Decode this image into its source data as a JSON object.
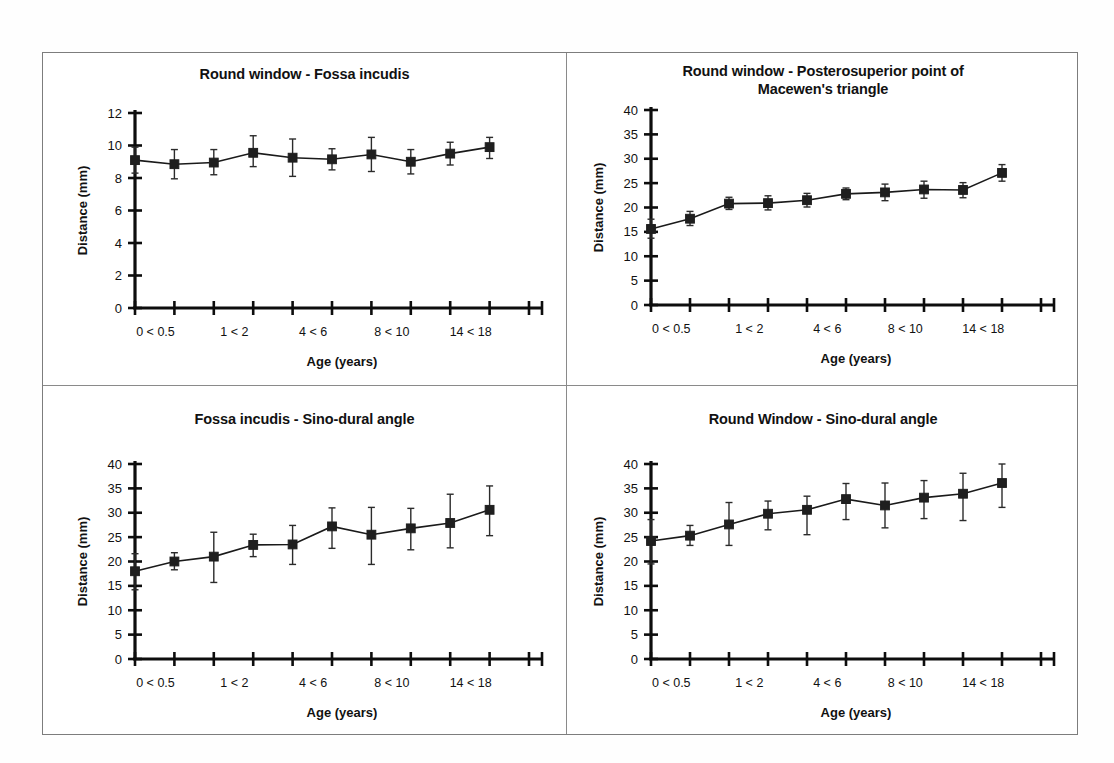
{
  "figure": {
    "background_color": "#ffffff",
    "frame_color": "#7d7d7d",
    "ink_color": "#1a1a1a"
  },
  "common": {
    "xlabel": "Age (years)",
    "ylabel": "Distance (mm)",
    "x_categories": [
      "0 < 0.5",
      "0.5 < 1",
      "1 < 2",
      "2 < 4",
      "4 < 6",
      "6 < 8",
      "8 < 10",
      "10 < 14",
      "14 < 18",
      "18 <",
      ""
    ],
    "x_visible_ticklabels": [
      {
        "index": 0,
        "text": "0 < 0.5"
      },
      {
        "index": 2,
        "text": "1 < 2"
      },
      {
        "index": 4,
        "text": "4 < 6"
      },
      {
        "index": 6,
        "text": "8 < 10"
      },
      {
        "index": 8,
        "text": "14 < 18"
      }
    ]
  },
  "chart_data": [
    {
      "id": "panel-a",
      "type": "line",
      "title": "Round window - Fossa incudis",
      "xlabel": "Age (years)",
      "ylabel": "Distance (mm)",
      "ylim": [
        0,
        12
      ],
      "yticks": [
        0,
        2,
        4,
        6,
        8,
        10,
        12
      ],
      "ytick_labels": [
        "0",
        "2",
        "4",
        "6",
        "8",
        "10",
        "12"
      ],
      "grid": false,
      "legend": "none",
      "x": [
        1,
        2,
        3,
        4,
        5,
        6,
        7,
        8,
        9,
        10,
        11
      ],
      "categories": [
        "0 < 0.5",
        "0.5 < 1",
        "1 < 2",
        "2 < 4",
        "4 < 6",
        "6 < 8",
        "8 < 10",
        "10 < 14",
        "14 < 18",
        "18 <",
        ""
      ],
      "values": [
        9.1,
        8.85,
        8.95,
        9.55,
        9.25,
        9.15,
        9.45,
        9.0,
        9.5,
        9.9
      ],
      "err_low": [
        8.3,
        7.95,
        8.2,
        8.7,
        8.1,
        8.5,
        8.4,
        8.25,
        8.8,
        9.2
      ],
      "err_high": [
        9.9,
        9.75,
        9.75,
        10.6,
        10.4,
        9.8,
        10.5,
        9.75,
        10.2,
        10.5
      ]
    },
    {
      "id": "panel-b",
      "type": "line",
      "title": "Round window - Posterosuperior point of Macewen's triangle",
      "title_lines": [
        "Round window - Posterosuperior point of",
        "Macewen's triangle"
      ],
      "xlabel": "Age (years)",
      "ylabel": "Distance (mm)",
      "ylim": [
        0,
        40
      ],
      "yticks": [
        0,
        5,
        10,
        15,
        20,
        25,
        30,
        35,
        40
      ],
      "ytick_labels": [
        "0",
        "5",
        "10",
        "15",
        "20",
        "25",
        "30",
        "35",
        "40"
      ],
      "grid": false,
      "legend": "none",
      "x": [
        1,
        2,
        3,
        4,
        5,
        6,
        7,
        8,
        9,
        10,
        11
      ],
      "categories": [
        "0 < 0.5",
        "0.5 < 1",
        "1 < 2",
        "2 < 4",
        "4 < 6",
        "6 < 8",
        "8 < 10",
        "10 < 14",
        "14 < 18",
        "18 <",
        ""
      ],
      "values": [
        15.6,
        17.7,
        20.8,
        20.9,
        21.5,
        22.8,
        23.1,
        23.7,
        23.6,
        27.1
      ],
      "err_low": [
        13.7,
        16.3,
        19.6,
        19.5,
        20.1,
        21.6,
        21.4,
        21.9,
        22.0,
        25.4
      ],
      "err_high": [
        17.6,
        19.2,
        22.1,
        22.4,
        22.9,
        24.0,
        24.8,
        25.4,
        25.1,
        28.8
      ]
    },
    {
      "id": "panel-c",
      "type": "line",
      "title": "Fossa incudis - Sino-dural angle",
      "xlabel": "Age (years)",
      "ylabel": "Distance (mm)",
      "ylim": [
        0,
        40
      ],
      "yticks": [
        0,
        5,
        10,
        15,
        20,
        25,
        30,
        35,
        40
      ],
      "ytick_labels": [
        "0",
        "5",
        "10",
        "15",
        "20",
        "25",
        "30",
        "35",
        "40"
      ],
      "grid": false,
      "legend": "none",
      "x": [
        1,
        2,
        3,
        4,
        5,
        6,
        7,
        8,
        9,
        10,
        11
      ],
      "categories": [
        "0 < 0.5",
        "0.5 < 1",
        "1 < 2",
        "2 < 4",
        "4 < 6",
        "6 < 8",
        "8 < 10",
        "10 < 14",
        "14 < 18",
        "18 <",
        ""
      ],
      "values": [
        18.0,
        20.0,
        21.0,
        23.4,
        23.5,
        27.2,
        25.5,
        26.8,
        27.9,
        30.6
      ],
      "err_low": [
        14.2,
        18.3,
        15.7,
        21.0,
        19.4,
        22.7,
        19.4,
        22.4,
        22.8,
        25.3
      ],
      "err_high": [
        21.6,
        21.8,
        26.0,
        25.6,
        27.4,
        31.0,
        31.1,
        30.9,
        33.8,
        35.5
      ]
    },
    {
      "id": "panel-d",
      "type": "line",
      "title": "Round Window - Sino-dural angle",
      "xlabel": "Age (years)",
      "ylabel": "Distance (mm)",
      "ylim": [
        0,
        40
      ],
      "yticks": [
        0,
        5,
        10,
        15,
        20,
        25,
        30,
        35,
        40
      ],
      "ytick_labels": [
        "0",
        "5",
        "10",
        "15",
        "20",
        "25",
        "30",
        "35",
        "40"
      ],
      "grid": false,
      "legend": "none",
      "x": [
        1,
        2,
        3,
        4,
        5,
        6,
        7,
        8,
        9,
        10,
        11
      ],
      "categories": [
        "0 < 0.5",
        "0.5 < 1",
        "1 < 2",
        "2 < 4",
        "4 < 6",
        "6 < 8",
        "8 < 10",
        "10 < 14",
        "14 < 18",
        "18 <",
        ""
      ],
      "values": [
        24.2,
        25.3,
        27.6,
        29.8,
        30.6,
        32.8,
        31.5,
        33.1,
        33.9,
        36.1
      ],
      "err_low": [
        19.5,
        23.3,
        23.3,
        26.5,
        25.5,
        28.6,
        26.9,
        28.8,
        28.4,
        31.1
      ],
      "err_high": [
        28.6,
        27.4,
        32.1,
        32.4,
        33.4,
        36.0,
        36.1,
        36.6,
        38.1,
        40.0
      ]
    }
  ]
}
